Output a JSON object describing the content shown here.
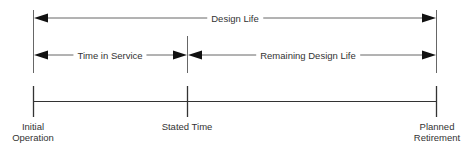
{
  "diagram": {
    "colors": {
      "line": "#555555",
      "arrow": "#111111",
      "text": "#333333",
      "background": "#ffffff"
    },
    "spans": [
      {
        "id": "design-life",
        "label": "Design Life",
        "from": "Initial Operation",
        "to": "Planned Retirement"
      },
      {
        "id": "time-in-service",
        "label": "Time in Service",
        "from": "Initial Operation",
        "to": "Stated Time"
      },
      {
        "id": "remaining-design-life",
        "label": "Remaining Design Life",
        "from": "Stated Time",
        "to": "Planned Retirement"
      }
    ],
    "points": [
      {
        "id": "initial-operation",
        "line1": "Initial",
        "line2": "Operation"
      },
      {
        "id": "stated-time",
        "line1": "Stated Time",
        "line2": ""
      },
      {
        "id": "planned-retirement",
        "line1": "Planned",
        "line2": "Retirement"
      }
    ]
  }
}
